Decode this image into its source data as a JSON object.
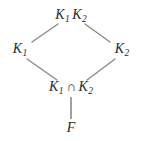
{
  "figure": {
    "kind": "lattice-diagram",
    "line_color": "#8a8a8a",
    "text_color": "#2b2b2b",
    "background_color": "#ffffff"
  },
  "nodes": {
    "top": {
      "id": "compositum",
      "base": "K",
      "sub1": "1",
      "base2": "K",
      "sub2": "2",
      "text": "K1K2",
      "x": 71,
      "y": 16
    },
    "left": {
      "id": "k1",
      "base": "K",
      "sub": "1",
      "text": "K1",
      "x": 20,
      "y": 50
    },
    "right": {
      "id": "k2",
      "base": "K",
      "sub": "2",
      "text": "K2",
      "x": 122,
      "y": 50
    },
    "meet": {
      "id": "intersection",
      "base": "K",
      "sub1": "1",
      "operator": "∩",
      "base2": "K",
      "sub2": "2",
      "text": "K1 ∩ K2",
      "x": 71,
      "y": 88
    },
    "base": {
      "id": "base-field",
      "label": "F",
      "x": 71,
      "y": 128
    }
  },
  "edges": [
    {
      "id": "edge-k1-compositum",
      "from": "left",
      "to": "top",
      "x1": 32,
      "y1": 42,
      "x2": 58,
      "y2": 24
    },
    {
      "id": "edge-k2-compositum",
      "from": "right",
      "to": "top",
      "x1": 110,
      "y1": 42,
      "x2": 85,
      "y2": 24
    },
    {
      "id": "edge-meet-k1",
      "from": "meet",
      "to": "left",
      "x1": 27,
      "y1": 59,
      "x2": 57,
      "y2": 80
    },
    {
      "id": "edge-meet-k2",
      "from": "meet",
      "to": "right",
      "x1": 115,
      "y1": 59,
      "x2": 87,
      "y2": 80
    },
    {
      "id": "edge-base-meet",
      "from": "base",
      "to": "meet",
      "x1": 71,
      "y1": 97,
      "x2": 71,
      "y2": 119
    }
  ]
}
